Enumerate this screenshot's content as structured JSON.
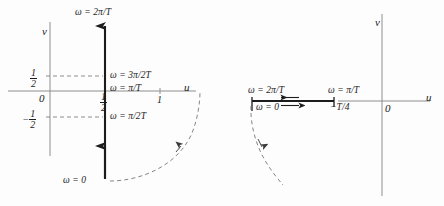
{
  "figure": {
    "type": "diagram",
    "background_color": "#fdfdfd",
    "ink_color": "#1c1c1c"
  },
  "left_panel": {
    "axes": {
      "u_label": "u",
      "v_label": "v",
      "origin_label": "0"
    },
    "ticks": {
      "u_one": "1",
      "v_half_num": "1",
      "v_half_den": "2",
      "v_neg_half_sign": "−",
      "v_neg_half_num": "1",
      "v_neg_half_den": "2",
      "u_half_num": "1",
      "u_half_den": "2"
    },
    "annotations": [
      {
        "name": "omega-2pi-over-T",
        "text": "ω = 2π/T"
      },
      {
        "name": "omega-3pi-over-2T",
        "text": "ω = 3π/2T"
      },
      {
        "name": "omega-pi-over-T",
        "text": "ω = π/T"
      },
      {
        "name": "omega-pi-over-2T",
        "text": "ω = π/2T"
      },
      {
        "name": "omega-zero",
        "text": "ω = 0"
      }
    ]
  },
  "right_panel": {
    "axes": {
      "u_label": "u",
      "v_label": "v",
      "origin_label": "0"
    },
    "annotations": [
      {
        "name": "omega-2pi-over-T",
        "text": "ω = 2π/T"
      },
      {
        "name": "omega-zero",
        "text": "ω = 0"
      },
      {
        "name": "omega-pi-over-T",
        "text": "ω = π/T"
      },
      {
        "name": "minus-T-over-4",
        "text": "−T/4"
      }
    ]
  }
}
